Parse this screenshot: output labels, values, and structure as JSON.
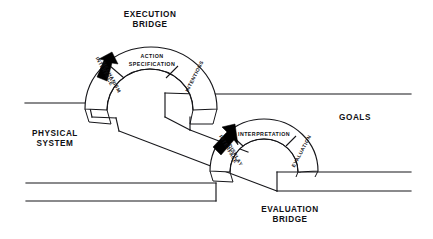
{
  "figure": {
    "title_execution": "EXECUTION",
    "title_execution_2": "BRIDGE",
    "title_evaluation": "EVALUATION",
    "title_evaluation_2": "BRIDGE",
    "label_physical": "PHYSICAL",
    "label_physical_2": "SYSTEM",
    "label_goals": "GOALS"
  },
  "execution_bridge": {
    "name": "EXECUTION BRIDGE",
    "segments": [
      {
        "id": "interface-mechanism",
        "line1": "INTERFACE",
        "line2": "MECHANISM",
        "orientation": "rotated",
        "position": "left"
      },
      {
        "id": "action-specification",
        "line1": "ACTION",
        "line2": "SPECIFICATION",
        "orientation": "horizontal",
        "position": "top"
      },
      {
        "id": "intentions",
        "line1": "INTENTIONS",
        "line2": "",
        "orientation": "rotated",
        "position": "right"
      }
    ],
    "arrow": {
      "id": "execution-arrow",
      "direction": "down-left",
      "color": "#000000"
    }
  },
  "evaluation_bridge": {
    "name": "EVALUATION BRIDGE",
    "segments": [
      {
        "id": "interface-display",
        "line1": "INTERFACE",
        "line2": "DISPLAY",
        "orientation": "rotated",
        "position": "left"
      },
      {
        "id": "interpretation",
        "line1": "INTERPRETATION",
        "line2": "",
        "orientation": "horizontal",
        "position": "top"
      },
      {
        "id": "evaluation",
        "line1": "EVALUATION",
        "line2": "",
        "orientation": "rotated",
        "position": "right"
      }
    ],
    "arrow": {
      "id": "evaluation-arrow",
      "direction": "up-right",
      "color": "#000000"
    }
  },
  "colors": {
    "ink": "#16161a",
    "paper": "#ffffff",
    "arrow": "#000000"
  }
}
